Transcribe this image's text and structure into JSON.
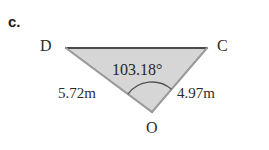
{
  "figure": {
    "part_label": "c.",
    "shape_name": "triangle-DOC",
    "fill_color": "#d6d6d6",
    "top_edge_color": "#4a4a4a",
    "side_edge_color": "#9a9a9a",
    "arc_color": "#555555",
    "background_color": "#ffffff",
    "vertices": [
      {
        "name": "D",
        "label": "D",
        "x": 66,
        "y": 48
      },
      {
        "name": "C",
        "label": "C",
        "x": 207,
        "y": 48
      },
      {
        "name": "O",
        "label": "O",
        "x": 152,
        "y": 112
      }
    ],
    "angle": {
      "at_vertex": "O",
      "value": "103.18",
      "unit": "°",
      "label": "103.18°"
    },
    "sides": [
      {
        "name": "side-DO",
        "label": "5.72m",
        "value": "5.72",
        "unit": "m"
      },
      {
        "name": "side-OC",
        "label": "4.97m",
        "value": "4.97",
        "unit": "m"
      }
    ]
  }
}
